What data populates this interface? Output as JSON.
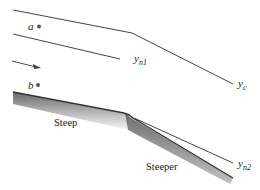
{
  "diagram": {
    "type": "open-channel flow profile (steep to steeper slope)",
    "colors": {
      "line": "#333333",
      "bed_shade_dark": "#555555",
      "bed_shade_light": "#ffffff",
      "text": "#222222"
    },
    "points": [
      {
        "id": "a",
        "label": "a"
      },
      {
        "id": "b",
        "label": "b"
      }
    ],
    "depth_labels": {
      "yn1": {
        "base": "y",
        "sub": "n1"
      },
      "yc": {
        "base": "y",
        "sub": "c"
      },
      "yn2": {
        "base": "y",
        "sub": "n2"
      }
    },
    "slope_labels": {
      "upstream": "Steep",
      "downstream": "Steeper"
    },
    "flow_arrow": "flow-direction"
  }
}
